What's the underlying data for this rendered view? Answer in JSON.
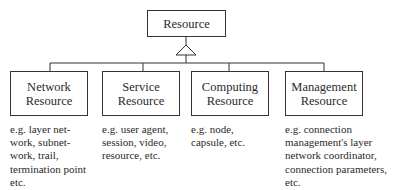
{
  "diagram": {
    "root": {
      "label": "Resource"
    },
    "relation": "generalization-triangle",
    "children": [
      {
        "label": "Network\nResource",
        "description": "e.g. layer net-\nwork, subnet-\nwork, trail,\ntermination point\netc."
      },
      {
        "label": "Service\nResource",
        "description": "e.g. user agent,\nsession, video,\nresource, etc."
      },
      {
        "label": "Computing\nResource",
        "description": "e.g. node,\ncapsule, etc."
      },
      {
        "label": "Management\nResource",
        "description": "e.g. connection\nmanagement's layer\nnetwork coordinator,\nconnection parameters,\netc."
      }
    ]
  }
}
